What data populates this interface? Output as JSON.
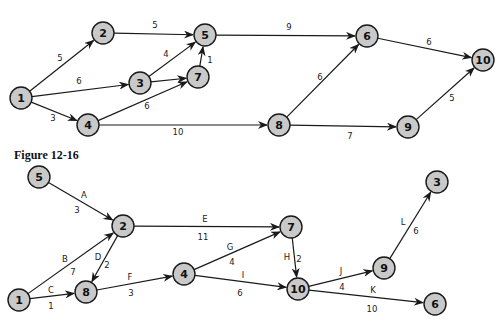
{
  "caption": "Figure 12-16",
  "colors": {
    "node_fill": "#c9c9c9",
    "stroke": "#1a1a1a",
    "background": "#ffffff"
  },
  "top_network": {
    "nodes": [
      {
        "id": "1",
        "x": 21,
        "y": 98
      },
      {
        "id": "2",
        "x": 103,
        "y": 33
      },
      {
        "id": "5",
        "x": 205,
        "y": 35
      },
      {
        "id": "3",
        "x": 140,
        "y": 83
      },
      {
        "id": "7",
        "x": 198,
        "y": 77
      },
      {
        "id": "4",
        "x": 88,
        "y": 125
      },
      {
        "id": "6",
        "x": 367,
        "y": 36
      },
      {
        "id": "10",
        "x": 483,
        "y": 60
      },
      {
        "id": "8",
        "x": 279,
        "y": 125
      },
      {
        "id": "9",
        "x": 408,
        "y": 127
      }
    ],
    "edges": [
      {
        "from": "1",
        "to": "2",
        "weight": "5",
        "lx": 60,
        "ly": 58
      },
      {
        "from": "2",
        "to": "5",
        "weight": "5",
        "lx": 155,
        "ly": 25
      },
      {
        "from": "1",
        "to": "3",
        "weight": "6",
        "lx": 79,
        "ly": 81
      },
      {
        "from": "1",
        "to": "4",
        "weight": "3",
        "lx": 53,
        "ly": 118
      },
      {
        "from": "3",
        "to": "5",
        "weight": "4",
        "lx": 166,
        "ly": 54
      },
      {
        "from": "3",
        "to": "7",
        "weight": "",
        "lx": 0,
        "ly": 0
      },
      {
        "from": "7",
        "to": "5",
        "weight": "1",
        "lx": 210,
        "ly": 60
      },
      {
        "from": "4",
        "to": "7",
        "weight": "6",
        "lx": 147,
        "ly": 106
      },
      {
        "from": "5",
        "to": "6",
        "weight": "9",
        "lx": 289,
        "ly": 27
      },
      {
        "from": "6",
        "to": "10",
        "weight": "6",
        "lx": 429,
        "ly": 42
      },
      {
        "from": "8",
        "to": "6",
        "weight": "6",
        "lx": 320,
        "ly": 77
      },
      {
        "from": "4",
        "to": "8",
        "weight": "10",
        "lx": 178,
        "ly": 132
      },
      {
        "from": "8",
        "to": "9",
        "weight": "7",
        "lx": 350,
        "ly": 136
      },
      {
        "from": "9",
        "to": "10",
        "weight": "5",
        "lx": 452,
        "ly": 98
      }
    ]
  },
  "bottom_network": {
    "nodes": [
      {
        "id": "5",
        "x": 39,
        "y": 177
      },
      {
        "id": "2",
        "x": 123,
        "y": 226
      },
      {
        "id": "7",
        "x": 291,
        "y": 227
      },
      {
        "id": "1",
        "x": 19,
        "y": 300
      },
      {
        "id": "8",
        "x": 86,
        "y": 292
      },
      {
        "id": "4",
        "x": 184,
        "y": 274
      },
      {
        "id": "10",
        "x": 298,
        "y": 289
      },
      {
        "id": "9",
        "x": 384,
        "y": 268
      },
      {
        "id": "3",
        "x": 437,
        "y": 182
      },
      {
        "id": "6",
        "x": 435,
        "y": 304
      }
    ],
    "edges": [
      {
        "from": "5",
        "to": "2",
        "activity": "A",
        "duration": "3",
        "ax": 84,
        "ay": 195,
        "dx": 77,
        "dy": 210
      },
      {
        "from": "2",
        "to": "7",
        "activity": "E",
        "duration": "11",
        "ax": 205,
        "ay": 219,
        "dx": 203,
        "dy": 237
      },
      {
        "from": "1",
        "to": "2",
        "activity": "B",
        "duration": "7",
        "ax": 65,
        "ay": 259,
        "dx": 73,
        "dy": 272
      },
      {
        "from": "2",
        "to": "8",
        "activity": "D",
        "duration": "2",
        "ax": 98,
        "ay": 257,
        "dx": 107,
        "dy": 265
      },
      {
        "from": "1",
        "to": "8",
        "activity": "C",
        "duration": "1",
        "ax": 51,
        "ay": 290,
        "dx": 51,
        "dy": 306
      },
      {
        "from": "8",
        "to": "4",
        "activity": "F",
        "duration": "3",
        "ax": 130,
        "ay": 277,
        "dx": 131,
        "dy": 293
      },
      {
        "from": "4",
        "to": "7",
        "activity": "G",
        "duration": "4",
        "ax": 230,
        "ay": 247,
        "dx": 232,
        "dy": 262
      },
      {
        "from": "4",
        "to": "10",
        "activity": "I",
        "duration": "6",
        "ax": 243,
        "ay": 275,
        "dx": 240,
        "dy": 293
      },
      {
        "from": "7",
        "to": "10",
        "activity": "H",
        "duration": "2",
        "ax": 287,
        "ay": 257,
        "dx": 299,
        "dy": 259
      },
      {
        "from": "10",
        "to": "9",
        "activity": "J",
        "duration": "4",
        "ax": 341,
        "ay": 271,
        "dx": 342,
        "dy": 287
      },
      {
        "from": "10",
        "to": "6",
        "activity": "K",
        "duration": "10",
        "ax": 373,
        "ay": 290,
        "dx": 372,
        "dy": 309
      },
      {
        "from": "9",
        "to": "3",
        "activity": "L",
        "duration": "6",
        "ax": 403,
        "ay": 222,
        "dx": 416,
        "dy": 231
      }
    ]
  }
}
